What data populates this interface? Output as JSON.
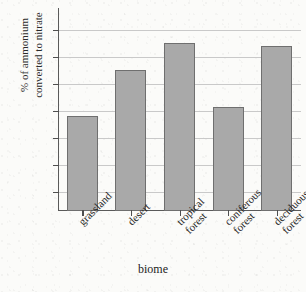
{
  "chart_data": {
    "type": "bar",
    "title": "",
    "xlabel": "biome",
    "ylabel_lines": [
      "% of ammonium",
      "converted to nitrate"
    ],
    "ylabel": "% of ammonium converted to nitrate",
    "categories": [
      "grassland",
      "desert",
      "tropical forest",
      "coniferous forest",
      "deciduous forest"
    ],
    "category_lines": [
      [
        "grassland"
      ],
      [
        "desert"
      ],
      [
        "tropical",
        "forest"
      ],
      [
        "coniferous",
        "forest"
      ],
      [
        "deciduous",
        "forest"
      ]
    ],
    "values": [
      48,
      65,
      75,
      51.5,
      74
    ],
    "yticks": [
      20,
      30,
      40,
      50,
      60,
      70,
      80
    ],
    "ylim": [
      13,
      88
    ],
    "grid": "horizontal",
    "legend": "none",
    "bar_color": "#a9a9a9",
    "bar_border_color": "#6f6f6f",
    "grid_color": "#c9c9c9",
    "axis_color": "#5a5a5a",
    "background_color": "#fbfbf9"
  }
}
